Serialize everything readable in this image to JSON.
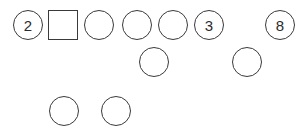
{
  "figure": {
    "title": "",
    "background_color": "#ffffff",
    "stroke_color": "#3a3a3c",
    "text_color": "#2b2b2d",
    "width": 303,
    "height": 137
  },
  "chart_data": {
    "type": "diagram",
    "title": "",
    "rows": [
      {
        "row_index": 0,
        "y": 10,
        "shapes": [
          {
            "shape": "circle",
            "label": "2",
            "x": 13,
            "y": 10,
            "size": 30
          },
          {
            "shape": "square",
            "label": "",
            "x": 48,
            "y": 10,
            "size": 30
          },
          {
            "shape": "circle",
            "label": "",
            "x": 84,
            "y": 10,
            "size": 30
          },
          {
            "shape": "circle",
            "label": "",
            "x": 122,
            "y": 10,
            "size": 30
          },
          {
            "shape": "circle",
            "label": "",
            "x": 158,
            "y": 10,
            "size": 30
          },
          {
            "shape": "circle",
            "label": "3",
            "x": 194,
            "y": 10,
            "size": 30
          },
          {
            "shape": "circle",
            "label": "8",
            "x": 265,
            "y": 10,
            "size": 30
          }
        ]
      },
      {
        "row_index": 1,
        "y": 47,
        "shapes": [
          {
            "shape": "circle",
            "label": "",
            "x": 139,
            "y": 47,
            "size": 30
          },
          {
            "shape": "circle",
            "label": "",
            "x": 232,
            "y": 47,
            "size": 30
          }
        ]
      },
      {
        "row_index": 2,
        "y": 96,
        "shapes": [
          {
            "shape": "circle",
            "label": "",
            "x": 49,
            "y": 96,
            "size": 30
          },
          {
            "shape": "circle",
            "label": "",
            "x": 101,
            "y": 96,
            "size": 30
          }
        ]
      }
    ],
    "labels": [
      "2",
      "3",
      "8"
    ],
    "counts": {
      "circles": 10,
      "squares": 1,
      "total_shapes": 11,
      "labelled_shapes": 3
    }
  }
}
